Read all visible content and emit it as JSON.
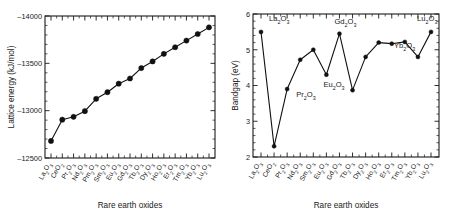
{
  "figure": {
    "background": "#ffffff",
    "ink_color": "#111111"
  },
  "chart_data": [
    {
      "panel": "left",
      "type": "line",
      "title": "",
      "xlabel": "Rare earth oxides",
      "ylabel": "Lattice energy (kJ/mol)",
      "ylim": [
        -12500,
        -14000
      ],
      "y_axis_inverted": true,
      "yticks": [
        -12500,
        -13000,
        -13500,
        -14000
      ],
      "ytick_labels": [
        "–12500",
        "–13000",
        "–13500",
        "–14000"
      ],
      "grid": false,
      "legend": "none",
      "marker": "filled-circle",
      "categories": [
        "La2O3",
        "CeO2",
        "Pr2O3",
        "Nd2O3",
        "Pm2O3",
        "Sm2O3",
        "Eu2O3",
        "Gd2O3",
        "Tb2O3",
        "Dy2O3",
        "Ho2O3",
        "Er2O3",
        "Tm2O3",
        "Yb2O3",
        "Lu2O3"
      ],
      "category_labels": [
        {
          "element": "La",
          "sub1": "2",
          "o": "O",
          "sub2": "3"
        },
        {
          "element": "Ce",
          "sub1": "",
          "o": "O",
          "sub2": "2"
        },
        {
          "element": "Pr",
          "sub1": "2",
          "o": "O",
          "sub2": "3"
        },
        {
          "element": "Nd",
          "sub1": "2",
          "o": "O",
          "sub2": "3"
        },
        {
          "element": "Pm",
          "sub1": "2",
          "o": "O",
          "sub2": "3"
        },
        {
          "element": "Sm",
          "sub1": "2",
          "o": "O",
          "sub2": "3"
        },
        {
          "element": "Eu",
          "sub1": "2",
          "o": "O",
          "sub2": "3"
        },
        {
          "element": "Gd",
          "sub1": "2",
          "o": "O",
          "sub2": "3"
        },
        {
          "element": "Tb",
          "sub1": "2",
          "o": "O",
          "sub2": "3"
        },
        {
          "element": "Dy",
          "sub1": "2",
          "o": "O",
          "sub2": "3"
        },
        {
          "element": "Ho",
          "sub1": "2",
          "o": "O",
          "sub2": "3"
        },
        {
          "element": "Er",
          "sub1": "2",
          "o": "O",
          "sub2": "3"
        },
        {
          "element": "Tm",
          "sub1": "2",
          "o": "O",
          "sub2": "3"
        },
        {
          "element": "Yb",
          "sub1": "2",
          "o": "O",
          "sub2": "3"
        },
        {
          "element": "Lu",
          "sub1": "2",
          "o": "O",
          "sub2": "3"
        }
      ],
      "values": [
        -12680,
        -12905,
        -12935,
        -12995,
        -13125,
        -13195,
        -13285,
        -13340,
        -13450,
        -13520,
        -13600,
        -13670,
        -13740,
        -13810,
        -13880
      ]
    },
    {
      "panel": "right",
      "type": "line",
      "title": "",
      "xlabel": "Rare earth oxides",
      "ylabel": "Bandgap (eV)",
      "ylim": [
        2,
        6
      ],
      "y_axis_inverted": false,
      "yticks": [
        2,
        3,
        4,
        5,
        6
      ],
      "ytick_labels": [
        "2",
        "3",
        "4",
        "5",
        "6"
      ],
      "grid": false,
      "legend": "none",
      "marker": "filled-circle",
      "categories": [
        "La2O3",
        "CeO2",
        "Pr2O3",
        "Nd2O3",
        "Sm2O3",
        "Eu2O3",
        "Gd2O3",
        "Tb2O3",
        "Dy2O3",
        "Ho2O3",
        "Er2O3",
        "Tm2O3",
        "Yb2O3",
        "Lu2O3"
      ],
      "category_labels": [
        {
          "element": "La",
          "sub1": "2",
          "o": "O",
          "sub2": "3"
        },
        {
          "element": "Ce",
          "sub1": "",
          "o": "O",
          "sub2": "2"
        },
        {
          "element": "Pr",
          "sub1": "2",
          "o": "O",
          "sub2": "3"
        },
        {
          "element": "Nd",
          "sub1": "2",
          "o": "O",
          "sub2": "3"
        },
        {
          "element": "Sm",
          "sub1": "2",
          "o": "O",
          "sub2": "3"
        },
        {
          "element": "Eu",
          "sub1": "2",
          "o": "O",
          "sub2": "3"
        },
        {
          "element": "Gd",
          "sub1": "2",
          "o": "O",
          "sub2": "3"
        },
        {
          "element": "Tb",
          "sub1": "2",
          "o": "O",
          "sub2": "3"
        },
        {
          "element": "Dy",
          "sub1": "2",
          "o": "O",
          "sub2": "3"
        },
        {
          "element": "Ho",
          "sub1": "2",
          "o": "O",
          "sub2": "3"
        },
        {
          "element": "Er",
          "sub1": "2",
          "o": "O",
          "sub2": "3"
        },
        {
          "element": "Tm",
          "sub1": "2",
          "o": "O",
          "sub2": "3"
        },
        {
          "element": "Yb",
          "sub1": "2",
          "o": "O",
          "sub2": "3"
        },
        {
          "element": "Lu",
          "sub1": "2",
          "o": "O",
          "sub2": "3"
        }
      ],
      "values": [
        5.5,
        2.3,
        3.9,
        4.72,
        5.0,
        4.3,
        5.45,
        3.87,
        4.8,
        5.2,
        5.17,
        5.22,
        4.8,
        5.5
      ],
      "annotations": [
        {
          "text_element": "La",
          "text_sub1": "2",
          "text_o": "O",
          "text_sub2": "3",
          "category": "La2O3",
          "value": 5.5,
          "dx": 8,
          "dy": -11
        },
        {
          "text_element": "Pr",
          "text_sub1": "2",
          "text_o": "O",
          "text_sub2": "3",
          "category": "Pr2O3",
          "value": 3.9,
          "dx": 9,
          "dy": 8
        },
        {
          "text_element": "Eu",
          "text_sub1": "2",
          "text_o": "O",
          "text_sub2": "3",
          "category": "Eu2O3",
          "value": 4.3,
          "dx": -3,
          "dy": 12
        },
        {
          "text_element": "Gd",
          "text_sub1": "2",
          "text_o": "O",
          "text_sub2": "3",
          "category": "Gd2O3",
          "value": 5.45,
          "dx": -5,
          "dy": -10
        },
        {
          "text_element": "Yb",
          "text_sub1": "2",
          "text_o": "O",
          "text_sub2": "3",
          "category": "Yb2O3",
          "value": 4.8,
          "dx": -24,
          "dy": -9
        },
        {
          "text_element": "Lu",
          "text_sub1": "2",
          "text_o": "O",
          "text_sub2": "3",
          "category": "Lu2O3",
          "value": 5.5,
          "dx": -14,
          "dy": -11
        }
      ]
    }
  ]
}
